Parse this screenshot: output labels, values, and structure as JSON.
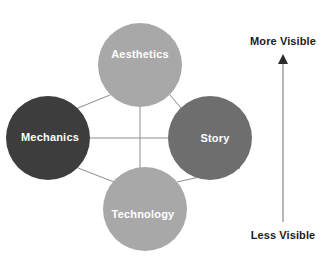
{
  "diagram": {
    "type": "mda-framework-diamond",
    "background_color": "#ffffff",
    "nodes": [
      {
        "id": "aesthetics",
        "label": "Aesthetics",
        "position": "top",
        "cx": 140,
        "cy": 65,
        "r": 42,
        "fill": "#a8a8a8",
        "text_color": "#ffffff"
      },
      {
        "id": "mechanics",
        "label": "Mechanics",
        "position": "left",
        "cx": 48,
        "cy": 138,
        "r": 42,
        "fill": "#3d3d3d",
        "text_color": "#ffffff"
      },
      {
        "id": "story",
        "label": "Story",
        "position": "right",
        "cx": 210,
        "cy": 138,
        "r": 42,
        "fill": "#6e6e6e",
        "text_color": "#ffffff"
      },
      {
        "id": "technology",
        "label": "Technology",
        "position": "bottom",
        "cx": 145,
        "cy": 209,
        "r": 42,
        "fill": "#a8a8a8",
        "text_color": "#ffffff"
      }
    ],
    "connectors": {
      "stroke_color": "#8c8c8c",
      "edges": [
        {
          "from": "mechanics",
          "to": "aesthetics",
          "kind": "diagonal"
        },
        {
          "from": "aesthetics",
          "to": "story",
          "kind": "diagonal"
        },
        {
          "from": "mechanics",
          "to": "technology",
          "kind": "diagonal"
        },
        {
          "from": "technology",
          "to": "story",
          "kind": "diagonal"
        },
        {
          "from": "mechanics",
          "to": "story",
          "kind": "horizontal"
        },
        {
          "from": "aesthetics",
          "to": "technology",
          "kind": "vertical"
        }
      ],
      "center_x": 140,
      "center_y": 138
    },
    "visibility_axis": {
      "top_label": "More Visible",
      "bottom_label": "Less Visible",
      "direction": "up",
      "shaft_x": 283,
      "shaft_top_y": 56,
      "shaft_bottom_y": 222,
      "label_color": "#1c1c1c",
      "arrow_color": "#2b2b2b"
    }
  }
}
